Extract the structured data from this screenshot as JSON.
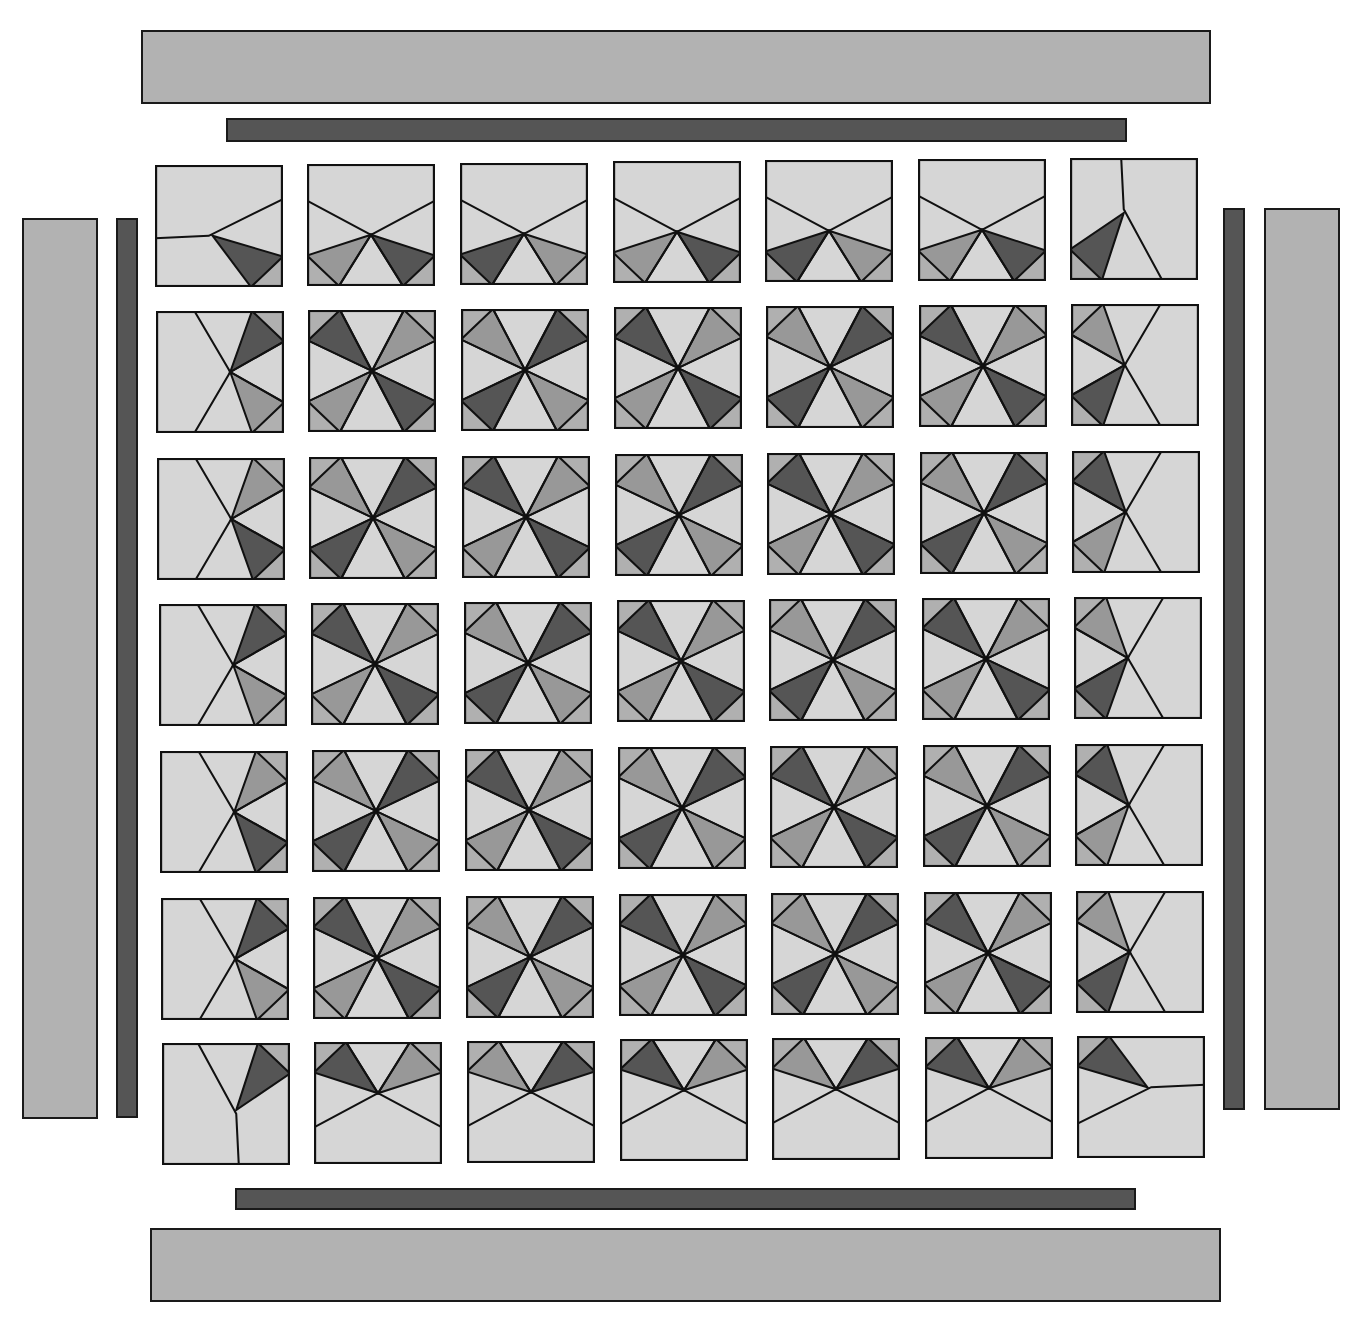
{
  "diagram": {
    "type": "quilt-layout",
    "grid": {
      "rows": 7,
      "cols": 7
    },
    "palette": {
      "background": "#d6d6d6",
      "medium": "#989898",
      "dark": "#555555",
      "corner": "#b0b0b0",
      "outline": "#111111",
      "wide_border": "#b2b2b2",
      "narrow_border": "#555555"
    },
    "borders": {
      "top_wide": {
        "x": 141,
        "y": 30,
        "w": 1070,
        "h": 74
      },
      "top_narrow": {
        "x": 226,
        "y": 118,
        "w": 901,
        "h": 24
      },
      "bottom_narrow": {
        "x": 235,
        "y": 1188,
        "w": 901,
        "h": 22
      },
      "bottom_wide": {
        "x": 150,
        "y": 1228,
        "w": 1071,
        "h": 74
      },
      "left_wide": {
        "x": 22,
        "y": 218,
        "w": 76,
        "h": 901
      },
      "left_narrow": {
        "x": 116,
        "y": 218,
        "w": 22,
        "h": 900
      },
      "right_narrow": {
        "x": 1223,
        "y": 208,
        "w": 22,
        "h": 902
      },
      "right_wide": {
        "x": 1264,
        "y": 208,
        "w": 76,
        "h": 902
      }
    },
    "block_types": {
      "center": "pinwheel-star-8-triangles",
      "top_edge": "half-star-top",
      "bottom_edge": "half-star-bottom",
      "left_edge": "half-star-left",
      "right_edge": "half-star-right",
      "corner": "quarter-star"
    }
  }
}
